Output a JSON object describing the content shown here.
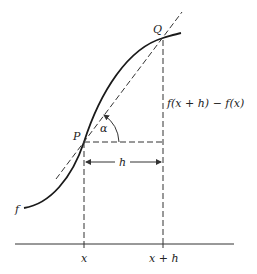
{
  "diagram": {
    "labels": {
      "point_p": "P",
      "point_q": "Q",
      "angle": "α",
      "rise": "f(x + h) − f(x)",
      "run": "h",
      "function": "f",
      "x_left": "x",
      "x_right": "x + h"
    },
    "colors": {
      "stroke": "#1a1a1a",
      "background": "#ffffff"
    }
  }
}
